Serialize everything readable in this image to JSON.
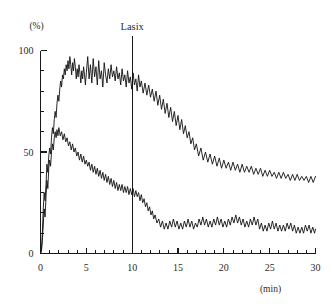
{
  "chart_data": {
    "type": "line",
    "title": "",
    "subtitle": "",
    "xlabel": "(min)",
    "ylabel": "(%)",
    "xlim": [
      0,
      30
    ],
    "ylim": [
      0,
      100
    ],
    "grid": false,
    "legend_position": "none",
    "x_ticks_major": [
      0,
      5,
      10,
      15,
      20,
      25,
      30
    ],
    "x_tick_labels": [
      "0",
      "5",
      "10",
      "15",
      "20",
      "25",
      "30"
    ],
    "x_tick_minor_step": 1,
    "y_ticks_major": [
      0,
      50,
      100
    ],
    "y_tick_labels": [
      "0",
      "50",
      "100"
    ],
    "y_tick_minor_step": 10,
    "annotations": [
      {
        "label": "Lasix",
        "type": "vertical-line",
        "x": 10,
        "y_top": 100,
        "y_bottom": 0
      }
    ],
    "series": [
      {
        "name": "upper-curve",
        "color": "#111111",
        "x": [
          0.0,
          0.1,
          0.2,
          0.3,
          0.4,
          0.5,
          0.6,
          0.7,
          0.8,
          0.9,
          1.0,
          1.1,
          1.2,
          1.3,
          1.4,
          1.5,
          1.6,
          1.7,
          1.8,
          1.9,
          2.0,
          2.1,
          2.2,
          2.3,
          2.4,
          2.5,
          2.6,
          2.7,
          2.8,
          2.9,
          3.0,
          3.1,
          3.2,
          3.3,
          3.4,
          3.5,
          3.6,
          3.7,
          3.8,
          3.9,
          4.0,
          4.1,
          4.2,
          4.3,
          4.4,
          4.5,
          4.6,
          4.7,
          4.8,
          4.9,
          5.0,
          5.15,
          5.3,
          5.45,
          5.6,
          5.75,
          5.9,
          6.05,
          6.2,
          6.35,
          6.5,
          6.65,
          6.8,
          6.95,
          7.1,
          7.25,
          7.4,
          7.55,
          7.7,
          7.85,
          8.0,
          8.15,
          8.3,
          8.45,
          8.6,
          8.75,
          8.9,
          9.05,
          9.2,
          9.35,
          9.5,
          9.65,
          9.8,
          9.95,
          10.1,
          10.25,
          10.4,
          10.55,
          10.7,
          10.85,
          11.0,
          11.2,
          11.4,
          11.6,
          11.8,
          12.0,
          12.2,
          12.4,
          12.6,
          12.8,
          13.0,
          13.2,
          13.4,
          13.6,
          13.8,
          14.0,
          14.2,
          14.4,
          14.6,
          14.8,
          15.0,
          15.2,
          15.4,
          15.6,
          15.8,
          16.0,
          16.2,
          16.4,
          16.6,
          16.8,
          17.0,
          17.25,
          17.5,
          17.75,
          18.0,
          18.25,
          18.5,
          18.75,
          19.0,
          19.25,
          19.5,
          19.75,
          20.0,
          20.25,
          20.5,
          20.75,
          21.0,
          21.25,
          21.5,
          21.75,
          22.0,
          22.25,
          22.5,
          22.75,
          23.0,
          23.25,
          23.5,
          23.75,
          24.0,
          24.25,
          24.5,
          24.75,
          25.0,
          25.25,
          25.5,
          25.75,
          26.0,
          26.25,
          26.5,
          26.75,
          27.0,
          27.25,
          27.5,
          27.75,
          28.0,
          28.25,
          28.5,
          28.75,
          29.0,
          29.25,
          29.5,
          29.75,
          30.0
        ],
        "y": [
          0.0,
          2.0,
          10.0,
          22.0,
          30.0,
          26.0,
          34.0,
          44.0,
          40.0,
          48.0,
          52.0,
          49.0,
          57.0,
          62.0,
          59.0,
          66.0,
          70.0,
          67.0,
          74.0,
          78.0,
          75.0,
          81.0,
          85.0,
          82.0,
          88.0,
          86.0,
          91.0,
          88.0,
          93.0,
          90.0,
          95.0,
          91.0,
          97.0,
          93.0,
          88.0,
          94.0,
          90.0,
          96.0,
          92.0,
          86.0,
          91.0,
          87.0,
          93.0,
          89.0,
          84.0,
          90.0,
          86.0,
          92.0,
          88.0,
          83.0,
          89.0,
          97.0,
          86.0,
          93.0,
          84.0,
          96.0,
          87.0,
          92.0,
          83.0,
          95.0,
          86.0,
          90.0,
          82.0,
          94.0,
          88.0,
          84.0,
          91.0,
          86.0,
          93.0,
          87.0,
          90.0,
          85.0,
          92.0,
          86.0,
          89.0,
          83.0,
          91.0,
          85.0,
          88.0,
          82.0,
          90.0,
          84.0,
          87.0,
          81.0,
          89.0,
          83.0,
          86.0,
          80.0,
          88.0,
          82.0,
          85.0,
          79.0,
          84.0,
          78.0,
          83.0,
          77.0,
          81.0,
          75.0,
          80.0,
          73.0,
          78.0,
          71.0,
          76.0,
          69.0,
          74.0,
          67.0,
          72.0,
          65.0,
          70.0,
          63.0,
          68.0,
          61.0,
          66.0,
          59.0,
          63.0,
          57.0,
          60.0,
          54.0,
          57.0,
          51.0,
          54.0,
          48.0,
          52.0,
          46.0,
          50.0,
          45.0,
          49.0,
          44.0,
          48.0,
          43.0,
          47.0,
          42.0,
          46.0,
          42.0,
          45.0,
          41.0,
          45.0,
          41.0,
          44.0,
          40.0,
          44.0,
          40.0,
          43.0,
          40.0,
          43.0,
          39.0,
          42.0,
          39.0,
          42.0,
          38.0,
          41.0,
          38.0,
          41.0,
          38.0,
          40.0,
          37.0,
          40.0,
          37.0,
          40.0,
          37.0,
          39.0,
          36.0,
          39.0,
          36.0,
          39.0,
          36.0,
          38.0,
          36.0,
          38.0,
          35.0,
          38.0,
          35.0,
          38.0
        ]
      },
      {
        "name": "lower-curve",
        "color": "#111111",
        "x": [
          0.0,
          0.1,
          0.2,
          0.3,
          0.4,
          0.5,
          0.6,
          0.7,
          0.8,
          0.9,
          1.0,
          1.1,
          1.2,
          1.3,
          1.4,
          1.5,
          1.6,
          1.7,
          1.8,
          1.9,
          2.0,
          2.15,
          2.3,
          2.45,
          2.6,
          2.75,
          2.9,
          3.05,
          3.2,
          3.35,
          3.5,
          3.65,
          3.8,
          3.95,
          4.1,
          4.25,
          4.4,
          4.55,
          4.7,
          4.85,
          5.0,
          5.15,
          5.3,
          5.45,
          5.6,
          5.75,
          5.9,
          6.05,
          6.2,
          6.35,
          6.5,
          6.65,
          6.8,
          6.95,
          7.1,
          7.25,
          7.4,
          7.55,
          7.7,
          7.85,
          8.0,
          8.15,
          8.3,
          8.45,
          8.6,
          8.75,
          8.9,
          9.05,
          9.2,
          9.35,
          9.5,
          9.65,
          9.8,
          9.95,
          10.1,
          10.25,
          10.4,
          10.55,
          10.7,
          10.85,
          11.0,
          11.15,
          11.3,
          11.45,
          11.6,
          11.75,
          11.9,
          12.05,
          12.2,
          12.35,
          12.5,
          12.7,
          12.9,
          13.1,
          13.3,
          13.5,
          13.7,
          13.9,
          14.1,
          14.3,
          14.5,
          14.7,
          14.9,
          15.1,
          15.3,
          15.5,
          15.7,
          15.9,
          16.1,
          16.3,
          16.5,
          16.7,
          16.9,
          17.1,
          17.3,
          17.5,
          17.7,
          17.9,
          18.1,
          18.3,
          18.5,
          18.7,
          18.9,
          19.1,
          19.3,
          19.5,
          19.7,
          19.9,
          20.1,
          20.3,
          20.5,
          20.7,
          20.9,
          21.1,
          21.3,
          21.5,
          21.7,
          21.9,
          22.1,
          22.3,
          22.5,
          22.7,
          22.9,
          23.1,
          23.3,
          23.5,
          23.7,
          23.9,
          24.1,
          24.3,
          24.5,
          24.7,
          24.9,
          25.1,
          25.3,
          25.5,
          25.7,
          25.9,
          26.1,
          26.3,
          26.5,
          26.7,
          26.9,
          27.1,
          27.3,
          27.5,
          27.7,
          27.9,
          28.1,
          28.3,
          28.5,
          28.7,
          28.9,
          29.1,
          29.3,
          29.5,
          29.7,
          29.9,
          30.0
        ],
        "y": [
          0.0,
          1.0,
          6.0,
          14.0,
          22.0,
          18.0,
          28.0,
          36.0,
          32.0,
          42.0,
          46.0,
          43.0,
          50.0,
          54.0,
          51.0,
          57.0,
          60.0,
          57.0,
          61.0,
          58.0,
          62.0,
          58.0,
          60.0,
          56.0,
          59.0,
          55.0,
          57.0,
          53.0,
          55.0,
          51.0,
          54.0,
          50.0,
          52.0,
          48.0,
          50.0,
          46.0,
          49.0,
          45.0,
          48.0,
          44.0,
          46.0,
          43.0,
          45.0,
          41.0,
          44.0,
          40.0,
          43.0,
          39.0,
          42.0,
          38.0,
          41.0,
          37.0,
          40.0,
          36.0,
          39.0,
          35.0,
          38.0,
          34.0,
          37.0,
          33.0,
          36.0,
          32.0,
          35.0,
          31.0,
          34.0,
          31.0,
          34.0,
          30.0,
          33.0,
          30.0,
          33.0,
          29.0,
          32.0,
          29.0,
          32.0,
          28.0,
          31.0,
          28.0,
          30.0,
          26.0,
          29.0,
          25.0,
          27.0,
          23.0,
          25.0,
          21.0,
          23.0,
          19.0,
          21.0,
          17.0,
          19.0,
          15.0,
          17.0,
          13.0,
          16.0,
          12.0,
          15.0,
          12.0,
          16.0,
          13.0,
          17.0,
          13.0,
          16.0,
          12.0,
          15.0,
          12.0,
          16.0,
          13.0,
          17.0,
          13.0,
          16.0,
          12.0,
          15.0,
          13.0,
          17.0,
          14.0,
          18.0,
          14.0,
          17.0,
          13.0,
          16.0,
          13.0,
          17.0,
          14.0,
          18.0,
          14.0,
          17.0,
          13.0,
          16.0,
          13.0,
          17.0,
          14.0,
          18.0,
          15.0,
          19.0,
          15.0,
          18.0,
          14.0,
          17.0,
          13.0,
          16.0,
          13.0,
          17.0,
          14.0,
          18.0,
          14.0,
          17.0,
          12.0,
          15.0,
          11.0,
          14.0,
          11.0,
          15.0,
          12.0,
          16.0,
          12.0,
          15.0,
          11.0,
          14.0,
          11.0,
          14.0,
          11.0,
          15.0,
          12.0,
          15.0,
          11.0,
          14.0,
          10.0,
          13.0,
          10.0,
          13.0,
          10.0,
          14.0,
          11.0,
          14.0,
          10.0,
          13.0,
          10.0,
          12.0
        ]
      }
    ]
  }
}
